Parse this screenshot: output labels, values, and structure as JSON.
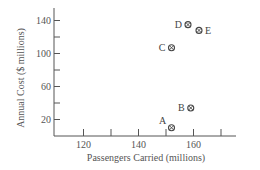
{
  "chart_data": {
    "type": "scatter",
    "title": "",
    "xlabel": "Passengers Carried (millions)",
    "ylabel": "Annual Cost ($ millions)",
    "xlim": [
      110,
      175
    ],
    "ylim": [
      0,
      155
    ],
    "x_ticks": [
      120,
      130,
      140,
      150,
      160,
      170
    ],
    "x_tick_labels": [
      "120",
      "",
      "140",
      "",
      "160",
      ""
    ],
    "y_ticks": [
      20,
      40,
      60,
      80,
      100,
      120,
      140
    ],
    "y_tick_labels": [
      "20",
      "",
      "60",
      "",
      "100",
      "",
      "140"
    ],
    "grid": false,
    "legend": null,
    "marker": "circled-cross",
    "points": [
      {
        "label": "A",
        "x": 152,
        "y": 10
      },
      {
        "label": "B",
        "x": 159,
        "y": 34
      },
      {
        "label": "C",
        "x": 152,
        "y": 107
      },
      {
        "label": "D",
        "x": 158,
        "y": 135
      },
      {
        "label": "E",
        "x": 162,
        "y": 128
      }
    ]
  },
  "colors": {
    "axis": "#555555",
    "marker": "#444444",
    "text": "#555555"
  }
}
